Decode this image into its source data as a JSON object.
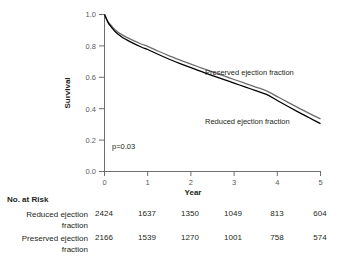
{
  "figure": {
    "type": "kaplan-meier-survival-figure"
  },
  "chart_data": {
    "type": "line",
    "title": "",
    "subtitle": "",
    "xlabel": "Year",
    "ylabel": "Survival",
    "xlim": [
      0,
      5
    ],
    "ylim": [
      0.0,
      1.0
    ],
    "xticks": [
      "0",
      "1",
      "2",
      "3",
      "4",
      "5"
    ],
    "yticks": [
      "0.0",
      "0.2",
      "0.4",
      "0.6",
      "0.8",
      "1.0"
    ],
    "grid": false,
    "legend_position": "inline-annotation",
    "annotations": [
      {
        "text": "p=0.03",
        "x": 0.18,
        "y": 0.14
      },
      {
        "text": "Preserved ejection fraction",
        "x": 2.35,
        "y": 0.58
      },
      {
        "text": "Reduced ejection fraction",
        "x": 2.35,
        "y": 0.37
      }
    ],
    "x": [
      0,
      0.08,
      0.17,
      0.25,
      0.4,
      0.6,
      0.85,
      1.0,
      1.25,
      1.5,
      1.75,
      2.0,
      2.25,
      2.5,
      2.75,
      3.0,
      3.25,
      3.5,
      3.75,
      4.0,
      4.25,
      4.5,
      4.75,
      5.0
    ],
    "series": [
      {
        "name": "Preserved ejection fraction",
        "color": "#6d6e71",
        "values": [
          1.0,
          0.955,
          0.925,
          0.902,
          0.872,
          0.843,
          0.812,
          0.797,
          0.766,
          0.737,
          0.71,
          0.684,
          0.659,
          0.634,
          0.61,
          0.586,
          0.562,
          0.538,
          0.514,
          0.477,
          0.44,
          0.404,
          0.369,
          0.335
        ]
      },
      {
        "name": "Reduced ejection fraction",
        "color": "#000000",
        "values": [
          1.0,
          0.95,
          0.916,
          0.89,
          0.857,
          0.826,
          0.793,
          0.777,
          0.745,
          0.715,
          0.687,
          0.661,
          0.636,
          0.611,
          0.587,
          0.563,
          0.539,
          0.515,
          0.491,
          0.452,
          0.414,
          0.377,
          0.341,
          0.305
        ]
      }
    ]
  },
  "risk_table": {
    "title": "No. at Risk",
    "column_positions": [
      0,
      1,
      2,
      3,
      4,
      5
    ],
    "rows": [
      {
        "label_line1": "Reduced ejection",
        "label_line2": "fraction",
        "values": [
          "2424",
          "1637",
          "1350",
          "1049",
          "813",
          "604"
        ]
      },
      {
        "label_line1": "Preserved ejection",
        "label_line2": "fraction",
        "values": [
          "2166",
          "1539",
          "1270",
          "1001",
          "758",
          "574"
        ]
      }
    ]
  },
  "colors": {
    "preserved_curve": "#6d6e71",
    "reduced_curve": "#000000",
    "axis": "#6d6e71",
    "text": "#231f20",
    "tick_text": "#58595b",
    "background": "#ffffff"
  }
}
